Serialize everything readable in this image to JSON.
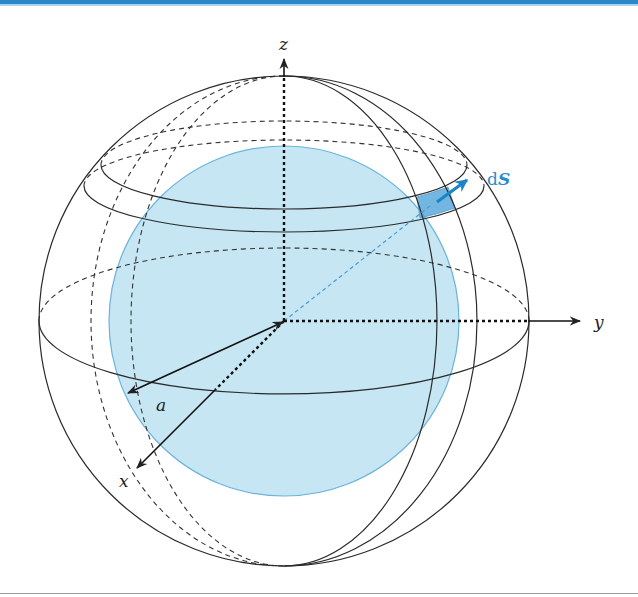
{
  "diagram": {
    "axes": {
      "x_label": "x",
      "y_label": "y",
      "z_label": "z"
    },
    "radius_label": "a",
    "surface_element": {
      "label_d": "d",
      "label_S": "S"
    },
    "colors": {
      "header_bar": "#2b87c8",
      "inner_sphere_fill": "#c6e6f3",
      "inner_sphere_stroke": "#6bb3dc",
      "patch_fill": "#5aa9dd",
      "normal_arrow": "#1d84c6",
      "ds_label": "#2a8ccc",
      "lines": "#2a2a2a"
    }
  }
}
